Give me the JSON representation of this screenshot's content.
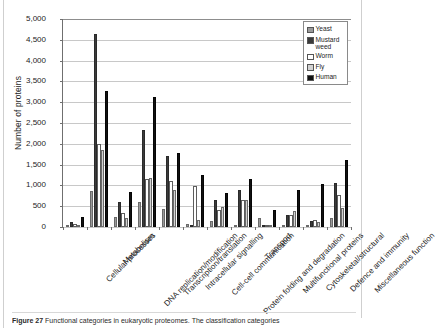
{
  "figure": {
    "caption_label": "Figure 27",
    "caption_text": "Functional categories in eukaryotic proteomes. The classification categories"
  },
  "legend": {
    "position": "top-right",
    "entries": [
      {
        "label": "Yeast",
        "color": "#9a9a9a"
      },
      {
        "label": "Mustard weed",
        "color": "#3b3b3b"
      },
      {
        "label": "Worm",
        "color": "#ffffff"
      },
      {
        "label": "Fly",
        "color": "#d2d2d2"
      },
      {
        "label": "Human",
        "color": "#111111"
      }
    ]
  },
  "chart_data": {
    "type": "bar",
    "title": "",
    "xlabel": "",
    "ylabel": "Number of proteins",
    "ylim": [
      0,
      5000
    ],
    "ytick_step": 500,
    "ytick_labels": [
      "0",
      "500",
      "1,000",
      "1,500",
      "2,000",
      "2,500",
      "3,000",
      "3,500",
      "4,000",
      "4,500",
      "5,000"
    ],
    "grid": true,
    "categories": [
      "Cellular processes",
      "Metabolism",
      "DNA replication/modification",
      "Transcription/translation",
      "Intracellular signalling",
      "Cell-cell communication",
      "Protein folding and degradation",
      "Transport",
      "Multifunctional proteins",
      "Cytoskeletal/structural",
      "Defence and immunity",
      "Miscellaneous function"
    ],
    "series": [
      {
        "name": "Yeast",
        "color": "#9a9a9a",
        "values": [
          30,
          870,
          250,
          610,
          440,
          70,
          150,
          10,
          210,
          30,
          10,
          210
        ]
      },
      {
        "name": "Mustard weed",
        "color": "#3b3b3b",
        "values": [
          120,
          4650,
          600,
          2330,
          1700,
          0,
          650,
          890,
          0,
          290,
          140,
          1060
        ]
      },
      {
        "name": "Worm",
        "color": "#ffffff",
        "values": [
          70,
          2000,
          340,
          1150,
          1110,
          990,
          420,
          640,
          60,
          300,
          180,
          760
        ]
      },
      {
        "name": "Fly",
        "color": "#d2d2d2",
        "values": [
          60,
          1850,
          220,
          1170,
          900,
          180,
          480,
          660,
          50,
          390,
          120,
          460
        ]
      },
      {
        "name": "Human",
        "color": "#111111",
        "values": [
          240,
          3280,
          850,
          3120,
          1790,
          1250,
          820,
          1150,
          420,
          900,
          1040,
          1600
        ]
      }
    ]
  }
}
